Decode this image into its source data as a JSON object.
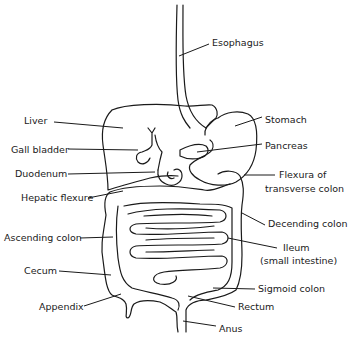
{
  "diagram": {
    "stroke_color": "#1a1a1a",
    "background": "#ffffff",
    "labels": {
      "esophagus": "Esophagus",
      "liver": "Liver",
      "stomach": "Stomach",
      "gall_bladder": "Gall bladder",
      "pancreas": "Pancreas",
      "duodenum": "Duodenum",
      "flexura_line1": "Flexura of",
      "flexura_line2": "transverse colon",
      "hepatic_flexure": "Hepatic flexure",
      "descending_colon": "Decending colon",
      "ascending_colon": "Ascending colon",
      "ileum_line1": "Ileum",
      "ileum_line2": "(small intestine)",
      "cecum": "Cecum",
      "sigmoid_colon": "Sigmoid colon",
      "appendix": "Appendix",
      "rectum": "Rectum",
      "anus": "Anus"
    }
  }
}
